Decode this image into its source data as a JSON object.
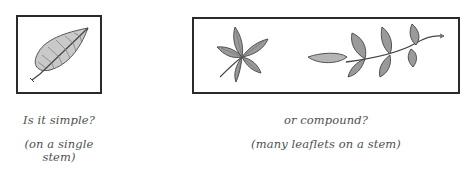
{
  "panels": [
    {
      "id": "simple",
      "illustration": "simple-leaf",
      "question": "Is it simple?",
      "note_line1": "(on a single",
      "note_line2": "stem)"
    },
    {
      "id": "compound",
      "illustration": [
        "palmate-compound-leaf",
        "pinnate-compound-leaf"
      ],
      "question": "or compound?",
      "note": "(many leaflets on a stem)"
    }
  ],
  "colors": {
    "border": "#2a2a2a",
    "leaf_fill": "#9a9a9a",
    "leaf_light": "#c8c8c8",
    "text": "#505050"
  }
}
